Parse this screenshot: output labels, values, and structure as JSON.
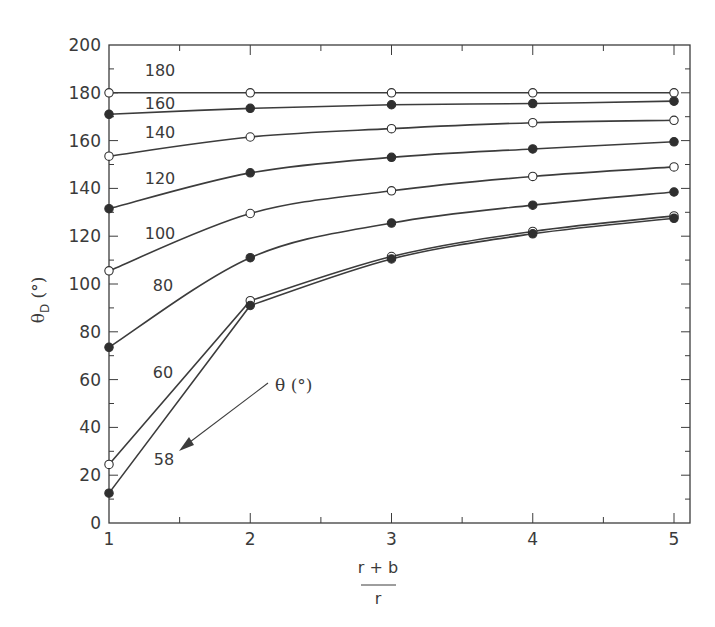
{
  "chart_data": {
    "type": "line",
    "title": "",
    "xlabel": "(r + b) / r",
    "xlabel_numerator": "r + b",
    "xlabel_denominator": "r",
    "ylabel": "θD (°)",
    "ylabel_main": "θ",
    "ylabel_sub": "D",
    "ylabel_unit": "(°)",
    "xlim": [
      1,
      5.1
    ],
    "ylim": [
      0,
      200
    ],
    "x": [
      1,
      2,
      3,
      4,
      5
    ],
    "xticks": [
      "1",
      "2",
      "3",
      "4",
      "5"
    ],
    "yticks": [
      "0",
      "20",
      "40",
      "60",
      "80",
      "100",
      "120",
      "140",
      "160",
      "180",
      "200"
    ],
    "grid": false,
    "legend_title": "θ (°)",
    "annotation": {
      "text": "θ (°)",
      "arrow_target": "58 curve"
    },
    "series": [
      {
        "name": "180",
        "marker": "open",
        "values": [
          180,
          180,
          180,
          180,
          180
        ]
      },
      {
        "name": "160",
        "marker": "filled",
        "values": [
          171,
          173.5,
          175,
          175.5,
          176.5
        ]
      },
      {
        "name": "140",
        "marker": "open",
        "values": [
          153.5,
          161.5,
          165,
          167.5,
          168.5
        ]
      },
      {
        "name": "120",
        "marker": "filled",
        "values": [
          131.5,
          146.5,
          153,
          156.5,
          159.5
        ]
      },
      {
        "name": "100",
        "marker": "open",
        "values": [
          105.5,
          129.5,
          139,
          145,
          149
        ]
      },
      {
        "name": "80",
        "marker": "filled",
        "values": [
          73.5,
          111,
          125.5,
          133,
          138.5
        ]
      },
      {
        "name": "60",
        "marker": "open",
        "values": [
          24.5,
          93,
          111.5,
          122,
          128.5
        ]
      },
      {
        "name": "58",
        "marker": "filled",
        "values": [
          12.5,
          91,
          110.5,
          121,
          127.5
        ]
      }
    ]
  }
}
